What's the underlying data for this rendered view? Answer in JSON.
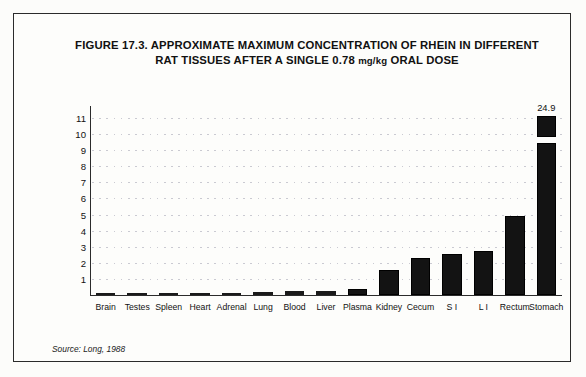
{
  "figure": {
    "title_line1": "FIGURE 17.3.  APPROXIMATE MAXIMUM CONCENTRATION OF RHEIN IN DIFFERENT",
    "title_line2_pre": "RAT TISSUES AFTER A SINGLE 0.78 ",
    "title_line2_unit": "mg/kg",
    "title_line2_post": " ORAL DOSE",
    "source": "Source: Long, 1988"
  },
  "chart_data": {
    "type": "bar",
    "title": "FIGURE 17.3. APPROXIMATE MAXIMUM CONCENTRATION OF RHEIN IN DIFFERENT RAT TISSUES AFTER A SINGLE 0.78 mg/kg ORAL DOSE",
    "xlabel": "",
    "ylabel": "Micrograms per gram",
    "ylim": [
      0,
      11.5
    ],
    "yticks": [
      1,
      2,
      3,
      4,
      5,
      6,
      7,
      8,
      9,
      10,
      11
    ],
    "grid": true,
    "legend": "none",
    "broken_axis": true,
    "categories": [
      "Brain",
      "Testes",
      "Spleen",
      "Heart",
      "Adrenal",
      "Lung",
      "Blood",
      "Liver",
      "Plasma",
      "Kidney",
      "Cecum",
      "S I",
      "L I",
      "Rectum",
      "Stomach"
    ],
    "values": [
      0.03,
      0.05,
      0.1,
      0.1,
      0.12,
      0.15,
      0.2,
      0.2,
      0.38,
      1.5,
      2.3,
      2.55,
      2.7,
      4.9,
      24.9
    ],
    "data_labels": [
      "",
      "",
      "",
      "",
      "",
      "",
      "",
      "",
      "",
      "",
      "",
      "",
      "",
      "",
      "24.9"
    ]
  }
}
